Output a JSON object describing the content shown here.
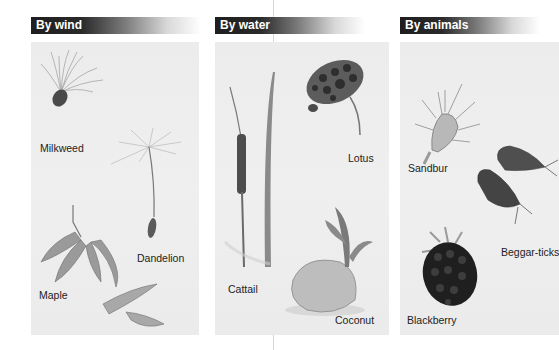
{
  "sections": [
    {
      "title": "By wind",
      "items": [
        {
          "name": "Milkweed"
        },
        {
          "name": "Dandelion"
        },
        {
          "name": "Maple"
        }
      ]
    },
    {
      "title": "By water",
      "items": [
        {
          "name": "Lotus"
        },
        {
          "name": "Cattail"
        },
        {
          "name": "Coconut"
        }
      ]
    },
    {
      "title": "By animals",
      "items": [
        {
          "name": "Sandbur"
        },
        {
          "name": "Beggar-ticks"
        },
        {
          "name": "Blackberry"
        }
      ]
    }
  ],
  "colors": {
    "header_bg": "#1e1e1e",
    "header_text": "#ffffff",
    "panel_bg": "#ececec",
    "label_text": "#222222"
  }
}
